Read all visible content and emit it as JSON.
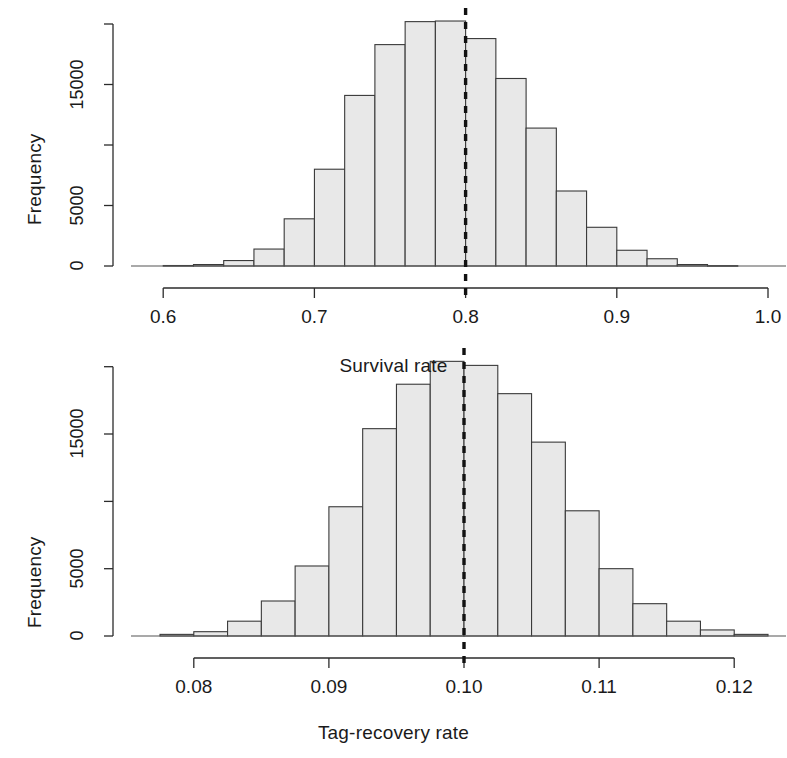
{
  "figure": {
    "background": "#ffffff",
    "bar_fill": "#e8e8e8",
    "bar_stroke": "#3a3a3a",
    "axis_color": "#2b2b2b",
    "reference_line_color": "#111111"
  },
  "panels": {
    "top": {
      "ylabel": "Frequency",
      "xlabel": "Survival rate",
      "y_ticks": [
        {
          "value": 0,
          "label": "0"
        },
        {
          "value": 5000,
          "label": "5000"
        },
        {
          "value": 10000,
          "label": ""
        },
        {
          "value": 15000,
          "label": "15000"
        },
        {
          "value": 20000,
          "label": ""
        }
      ],
      "x_ticks": [
        {
          "value": 0.6,
          "label": "0.6"
        },
        {
          "value": 0.7,
          "label": "0.7"
        },
        {
          "value": 0.8,
          "label": "0.8"
        },
        {
          "value": 0.9,
          "label": "0.9"
        },
        {
          "value": 1.0,
          "label": "1.0"
        }
      ],
      "reference_line": 0.8
    },
    "bottom": {
      "ylabel": "Frequency",
      "xlabel": "Tag-recovery rate",
      "y_ticks": [
        {
          "value": 0,
          "label": "0"
        },
        {
          "value": 5000,
          "label": "5000"
        },
        {
          "value": 10000,
          "label": ""
        },
        {
          "value": 15000,
          "label": "15000"
        },
        {
          "value": 20000,
          "label": ""
        }
      ],
      "x_ticks": [
        {
          "value": 0.08,
          "label": "0.08"
        },
        {
          "value": 0.09,
          "label": "0.09"
        },
        {
          "value": 0.1,
          "label": "0.10"
        },
        {
          "value": 0.11,
          "label": "0.11"
        },
        {
          "value": 0.12,
          "label": "0.12"
        }
      ],
      "reference_line": 0.1
    }
  },
  "chart_data": [
    {
      "type": "bar",
      "id": "survival-rate-histogram",
      "title": "",
      "xlabel": "Survival rate",
      "ylabel": "Frequency",
      "xlim": [
        0.58,
        1.0
      ],
      "ylim": [
        0,
        20500
      ],
      "grid": false,
      "legend": "none",
      "bin_width": 0.02,
      "annotations": [
        {
          "kind": "vertical-dashed-line",
          "x": 0.8,
          "label": "true value"
        }
      ],
      "bins": [
        {
          "x0": 0.6,
          "x1": 0.62,
          "value": 40
        },
        {
          "x0": 0.62,
          "x1": 0.64,
          "value": 120
        },
        {
          "x0": 0.64,
          "x1": 0.66,
          "value": 450
        },
        {
          "x0": 0.66,
          "x1": 0.68,
          "value": 1400
        },
        {
          "x0": 0.68,
          "x1": 0.7,
          "value": 3900
        },
        {
          "x0": 0.7,
          "x1": 0.72,
          "value": 8000
        },
        {
          "x0": 0.72,
          "x1": 0.74,
          "value": 14100
        },
        {
          "x0": 0.74,
          "x1": 0.76,
          "value": 18300
        },
        {
          "x0": 0.76,
          "x1": 0.78,
          "value": 20200
        },
        {
          "x0": 0.78,
          "x1": 0.8,
          "value": 20250
        },
        {
          "x0": 0.8,
          "x1": 0.82,
          "value": 18800
        },
        {
          "x0": 0.82,
          "x1": 0.84,
          "value": 15500
        },
        {
          "x0": 0.84,
          "x1": 0.86,
          "value": 11400
        },
        {
          "x0": 0.86,
          "x1": 0.88,
          "value": 6200
        },
        {
          "x0": 0.88,
          "x1": 0.9,
          "value": 3200
        },
        {
          "x0": 0.9,
          "x1": 0.92,
          "value": 1300
        },
        {
          "x0": 0.92,
          "x1": 0.94,
          "value": 600
        },
        {
          "x0": 0.94,
          "x1": 0.96,
          "value": 120
        },
        {
          "x0": 0.96,
          "x1": 0.98,
          "value": 30
        }
      ]
    },
    {
      "type": "bar",
      "id": "tag-recovery-rate-histogram",
      "title": "",
      "xlabel": "Tag-recovery rate",
      "ylabel": "Frequency",
      "xlim": [
        0.0755,
        0.1225
      ],
      "ylim": [
        0,
        20500
      ],
      "grid": false,
      "legend": "none",
      "bin_width": 0.0025,
      "annotations": [
        {
          "kind": "vertical-dashed-line",
          "x": 0.1,
          "label": "true value"
        }
      ],
      "bins": [
        {
          "x0": 0.0775,
          "x1": 0.08,
          "value": 120
        },
        {
          "x0": 0.08,
          "x1": 0.0825,
          "value": 320
        },
        {
          "x0": 0.0825,
          "x1": 0.085,
          "value": 1100
        },
        {
          "x0": 0.085,
          "x1": 0.0875,
          "value": 2600
        },
        {
          "x0": 0.0875,
          "x1": 0.09,
          "value": 5200
        },
        {
          "x0": 0.09,
          "x1": 0.0925,
          "value": 9600
        },
        {
          "x0": 0.0925,
          "x1": 0.095,
          "value": 15400
        },
        {
          "x0": 0.095,
          "x1": 0.0975,
          "value": 18700
        },
        {
          "x0": 0.0975,
          "x1": 0.1,
          "value": 20400
        },
        {
          "x0": 0.1,
          "x1": 0.1025,
          "value": 20100
        },
        {
          "x0": 0.1025,
          "x1": 0.105,
          "value": 18000
        },
        {
          "x0": 0.105,
          "x1": 0.1075,
          "value": 14400
        },
        {
          "x0": 0.1075,
          "x1": 0.11,
          "value": 9300
        },
        {
          "x0": 0.11,
          "x1": 0.1125,
          "value": 5000
        },
        {
          "x0": 0.1125,
          "x1": 0.115,
          "value": 2400
        },
        {
          "x0": 0.115,
          "x1": 0.1175,
          "value": 1100
        },
        {
          "x0": 0.1175,
          "x1": 0.12,
          "value": 450
        },
        {
          "x0": 0.12,
          "x1": 0.1225,
          "value": 120
        }
      ]
    }
  ]
}
